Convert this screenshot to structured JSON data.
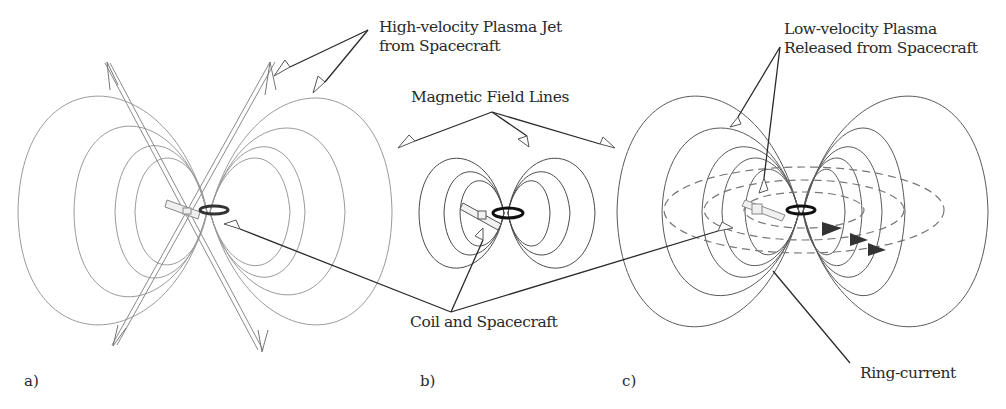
{
  "figure": {
    "panels": [
      {
        "id": "a",
        "label": "a)"
      },
      {
        "id": "b",
        "label": "b)"
      },
      {
        "id": "c",
        "label": "c)"
      }
    ],
    "annotations": {
      "jet_line1": "High-velocity Plasma Jet",
      "jet_line2": "from Spacecraft",
      "field_lines": "Magnetic Field Lines",
      "coil": "Coil and Spacecraft",
      "low_line1": "Low-velocity Plasma",
      "low_line2": "Released from Spacecraft",
      "ring": "Ring-current"
    },
    "colors": {
      "field_line_a": "#9a9a9a",
      "field_line_b": "#4a4a4a",
      "field_line_c": "#5a5a5a",
      "leader": "#2a2a2a",
      "coil": "#1a1a1a",
      "ring_current_dash": "#777777",
      "text": "#2a2a2a"
    }
  }
}
